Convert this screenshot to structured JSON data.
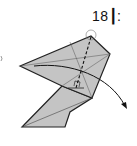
{
  "step": {
    "number": "18",
    "suffix": "┆:",
    "label": "18┃:"
  },
  "colors": {
    "paper": "#c4c4c4",
    "outline": "#222222",
    "background": "#ffffff"
  },
  "annotations": {
    "circle_marker": "pivot-point",
    "dashed_line": "fold-line",
    "right_angle": "right-angle-symbol",
    "arrow": "fold-direction-arrow"
  }
}
